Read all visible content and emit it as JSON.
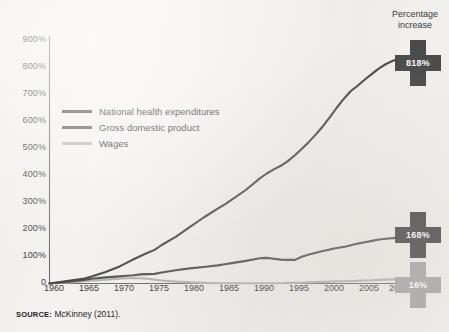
{
  "figure": {
    "background_color": "#f4f2ef",
    "axis_color": "#6e6e6e",
    "callout_title_line1": "Percentage",
    "callout_title_line2": "increase",
    "source_key": "SOURCE:",
    "source_text": "McKinney (2011)."
  },
  "chart_data": {
    "type": "line",
    "title": "",
    "subtitle": "",
    "xlabel": "",
    "ylabel": "",
    "xlim": [
      1960,
      2010
    ],
    "ylim": [
      0,
      900
    ],
    "grid": false,
    "legend_position": "inside-upper-left",
    "x_tick_labels": [
      "1960",
      "1965",
      "1970",
      "1975",
      "1980",
      "1985",
      "1990",
      "1995",
      "2000",
      "2005",
      "2010"
    ],
    "x_ticks": [
      1960,
      1965,
      1970,
      1975,
      1980,
      1985,
      1990,
      1995,
      2000,
      2005,
      2010
    ],
    "y_tick_labels": [
      "0",
      "100%",
      "200%",
      "300%",
      "400%",
      "500%",
      "600%",
      "700%",
      "800%",
      "900%"
    ],
    "y_ticks": [
      0,
      100,
      200,
      300,
      400,
      500,
      600,
      700,
      800,
      900
    ],
    "x": [
      1960,
      1962,
      1964,
      1965,
      1966,
      1968,
      1970,
      1971,
      1972,
      1973,
      1974,
      1975,
      1976,
      1978,
      1980,
      1982,
      1984,
      1985,
      1986,
      1988,
      1990,
      1991,
      1992,
      1993,
      1994,
      1995,
      1996,
      1997,
      1998,
      1999,
      2000,
      2001,
      2002,
      2003,
      2004,
      2005,
      2006,
      2007,
      2008,
      2009,
      2010
    ],
    "series": [
      {
        "name": "National health expenditures",
        "color": "#4a4a4a",
        "end_label": "818%",
        "values": [
          0,
          7,
          14,
          18,
          25,
          42,
          62,
          75,
          88,
          100,
          112,
          122,
          140,
          170,
          205,
          240,
          272,
          288,
          305,
          340,
          382,
          400,
          415,
          428,
          445,
          466,
          490,
          515,
          542,
          572,
          605,
          640,
          672,
          700,
          720,
          742,
          762,
          782,
          798,
          810,
          818
        ]
      },
      {
        "name": "Gross domestic product",
        "color": "#555555",
        "end_label": "168%",
        "values": [
          0,
          5,
          10,
          13,
          17,
          22,
          26,
          28,
          30,
          33,
          34,
          35,
          40,
          48,
          55,
          60,
          66,
          70,
          74,
          82,
          92,
          93,
          90,
          87,
          86,
          86,
          97,
          105,
          112,
          118,
          124,
          129,
          133,
          139,
          145,
          150,
          155,
          160,
          163,
          165,
          168
        ]
      },
      {
        "name": "Wages",
        "color": "#b6b6b6",
        "end_label": "16%",
        "values": [
          0,
          3,
          6,
          8,
          10,
          14,
          17,
          19,
          20,
          19,
          17,
          14,
          11,
          7,
          4,
          2,
          1,
          1,
          1,
          1,
          1,
          1,
          1,
          1,
          2,
          2,
          3,
          4,
          5,
          6,
          7,
          8,
          8,
          9,
          10,
          11,
          12,
          13,
          14,
          15,
          16
        ]
      }
    ],
    "annotations": [
      {
        "label": "818%",
        "series": "National health expenditures",
        "shape": "cross",
        "color": "#4a4a4a",
        "text_color": "#ffffff"
      },
      {
        "label": "168%",
        "series": "Gross domestic product",
        "shape": "cross",
        "color": "#4a4a4a",
        "text_color": "#ffffff"
      },
      {
        "label": "16%",
        "series": "Wages",
        "shape": "cross",
        "color": "#aaaaaa",
        "text_color": "#ffffff"
      }
    ]
  }
}
